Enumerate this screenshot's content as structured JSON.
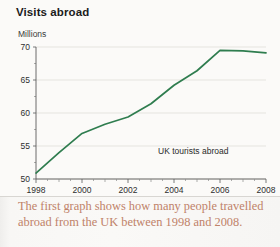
{
  "figure": {
    "title": "Visits abroad",
    "y_axis_unit": "Millions",
    "legend_label": "UK tourists abroad",
    "line_color": "#2f7d4f",
    "grid_color": "#dcdad6",
    "axis_color": "#5c5c5c"
  },
  "caption": {
    "text": "The first graph shows how many people travelled abroad from the UK between 1998 and 2008.",
    "color": "#c08269"
  },
  "chart_data": {
    "type": "line",
    "title": "Visits abroad",
    "xlabel": "",
    "ylabel": "Millions",
    "ylim": [
      50,
      70
    ],
    "xlim": [
      1998,
      2008
    ],
    "grid": true,
    "legend_position": "inside-lower-right",
    "y_ticks": [
      50,
      55,
      60,
      65,
      70
    ],
    "y_tick_labels": [
      "50",
      "55",
      "60",
      "65",
      "70"
    ],
    "x_ticks": [
      1998,
      1999,
      2000,
      2001,
      2002,
      2003,
      2004,
      2005,
      2006,
      2007,
      2008
    ],
    "x_tick_labels": [
      "1998",
      "",
      "2000",
      "",
      "2002",
      "",
      "2004",
      "",
      "2006",
      "",
      "2008"
    ],
    "x_labeled_ticks": [
      "1998",
      "2000",
      "2002",
      "2004",
      "2006",
      "2008"
    ],
    "categories": [
      1998,
      1999,
      2000,
      2001,
      2002,
      2003,
      2004,
      2005,
      2006,
      2007,
      2008
    ],
    "series": [
      {
        "name": "UK tourists abroad",
        "color": "#2f7d4f",
        "values": [
          50.9,
          54.0,
          56.9,
          58.3,
          59.4,
          61.4,
          64.2,
          66.4,
          69.5,
          69.4,
          69.1
        ]
      }
    ]
  }
}
